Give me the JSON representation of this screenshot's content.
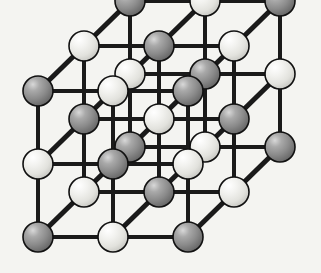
{
  "figure": {
    "background_color": "#f4f4f1",
    "bond_color": "#1a1a1a",
    "sphere_outline_color": "#111111",
    "dark_sphere_color": "#8a8a8a",
    "dark_sphere_highlight": "#d2d2d2",
    "dark_sphere_shadow": "#5a5a5a",
    "light_sphere_color": "#e8e8e4",
    "light_sphere_highlight": "#ffffff",
    "light_sphere_shadow": "#b9b9b4"
  },
  "chart_data": {
    "type": "scatter",
    "xlabel": "",
    "ylabel": "",
    "grid": false,
    "legend": [],
    "lattice": {
      "grid_size": [
        3,
        3,
        3
      ],
      "spacing_x": 75,
      "spacing_y": 73,
      "depth_dx": 46,
      "depth_dy": -45,
      "origin_x": 38,
      "origin_y": 237,
      "sphere_radius_dark": 15,
      "sphere_radius_light": 15,
      "bond_width": 4,
      "depth_bond_width": 5,
      "species": [
        "dark",
        "light"
      ],
      "rule": "parity of (i+j+k): even -> dark, odd -> light"
    },
    "atoms": [
      {
        "i": 0,
        "j": 0,
        "k": 0,
        "x": 38,
        "y": 237,
        "type": "dark"
      },
      {
        "i": 1,
        "j": 0,
        "k": 0,
        "x": 113,
        "y": 237,
        "type": "light"
      },
      {
        "i": 2,
        "j": 0,
        "k": 0,
        "x": 188,
        "y": 237,
        "type": "dark"
      },
      {
        "i": 0,
        "j": 1,
        "k": 0,
        "x": 38,
        "y": 164,
        "type": "light"
      },
      {
        "i": 1,
        "j": 1,
        "k": 0,
        "x": 113,
        "y": 164,
        "type": "dark"
      },
      {
        "i": 2,
        "j": 1,
        "k": 0,
        "x": 188,
        "y": 164,
        "type": "light"
      },
      {
        "i": 0,
        "j": 2,
        "k": 0,
        "x": 38,
        "y": 91,
        "type": "dark"
      },
      {
        "i": 1,
        "j": 2,
        "k": 0,
        "x": 113,
        "y": 91,
        "type": "light"
      },
      {
        "i": 2,
        "j": 2,
        "k": 0,
        "x": 188,
        "y": 91,
        "type": "dark"
      },
      {
        "i": 0,
        "j": 0,
        "k": 1,
        "x": 84,
        "y": 192,
        "type": "light"
      },
      {
        "i": 1,
        "j": 0,
        "k": 1,
        "x": 159,
        "y": 192,
        "type": "dark"
      },
      {
        "i": 2,
        "j": 0,
        "k": 1,
        "x": 234,
        "y": 192,
        "type": "light"
      },
      {
        "i": 0,
        "j": 1,
        "k": 1,
        "x": 84,
        "y": 119,
        "type": "dark"
      },
      {
        "i": 1,
        "j": 1,
        "k": 1,
        "x": 159,
        "y": 119,
        "type": "light"
      },
      {
        "i": 2,
        "j": 1,
        "k": 1,
        "x": 234,
        "y": 119,
        "type": "dark"
      },
      {
        "i": 0,
        "j": 2,
        "k": 1,
        "x": 84,
        "y": 46,
        "type": "light"
      },
      {
        "i": 1,
        "j": 2,
        "k": 1,
        "x": 159,
        "y": 46,
        "type": "dark"
      },
      {
        "i": 2,
        "j": 2,
        "k": 1,
        "x": 234,
        "y": 46,
        "type": "light"
      },
      {
        "i": 0,
        "j": 0,
        "k": 2,
        "x": 130,
        "y": 147,
        "type": "dark"
      },
      {
        "i": 1,
        "j": 0,
        "k": 2,
        "x": 205,
        "y": 147,
        "type": "light"
      },
      {
        "i": 2,
        "j": 0,
        "k": 2,
        "x": 280,
        "y": 147,
        "type": "dark"
      },
      {
        "i": 0,
        "j": 1,
        "k": 2,
        "x": 130,
        "y": 74,
        "type": "light"
      },
      {
        "i": 1,
        "j": 1,
        "k": 2,
        "x": 205,
        "y": 74,
        "type": "dark"
      },
      {
        "i": 2,
        "j": 1,
        "k": 2,
        "x": 280,
        "y": 74,
        "type": "light"
      },
      {
        "i": 0,
        "j": 2,
        "k": 2,
        "x": 130,
        "y": 1,
        "type": "dark"
      },
      {
        "i": 1,
        "j": 2,
        "k": 2,
        "x": 205,
        "y": 1,
        "type": "light"
      },
      {
        "i": 2,
        "j": 2,
        "k": 2,
        "x": 280,
        "y": 1,
        "type": "dark"
      }
    ]
  }
}
